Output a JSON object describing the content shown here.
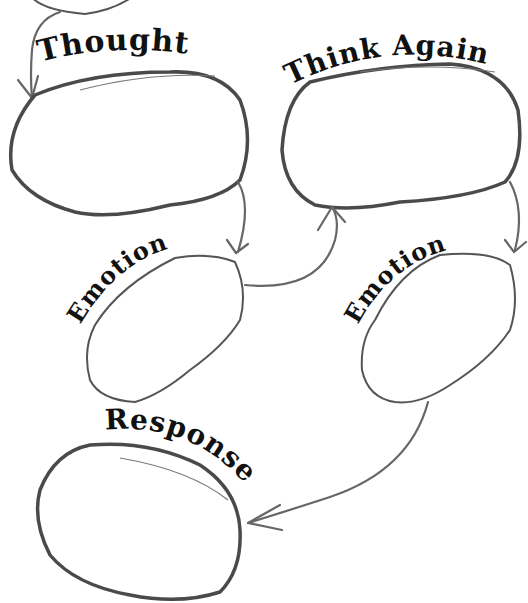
{
  "diagram": {
    "type": "cognitive-flow-worksheet",
    "nodes": [
      {
        "id": "thought",
        "label": "Thought",
        "content": ""
      },
      {
        "id": "think_again",
        "label": "Think Again",
        "content": ""
      },
      {
        "id": "emotion_1",
        "label": "Emotion",
        "content": ""
      },
      {
        "id": "emotion_2",
        "label": "Emotion",
        "content": ""
      },
      {
        "id": "response",
        "label": "Response",
        "content": ""
      }
    ],
    "edges": [
      {
        "from": "previous",
        "to": "thought"
      },
      {
        "from": "thought",
        "to": "emotion_1"
      },
      {
        "from": "emotion_1",
        "to": "think_again"
      },
      {
        "from": "think_again",
        "to": "emotion_2"
      },
      {
        "from": "emotion_2",
        "to": "response"
      }
    ]
  },
  "labels": {
    "thought": "Thought",
    "think_again": "Think Again",
    "emotion_1": "Emotion",
    "emotion_2": "Emotion",
    "response": "Response"
  },
  "colors": {
    "ink": "#111111",
    "outline": "#4a4a4a",
    "arrow": "#666666",
    "background": "#ffffff"
  }
}
